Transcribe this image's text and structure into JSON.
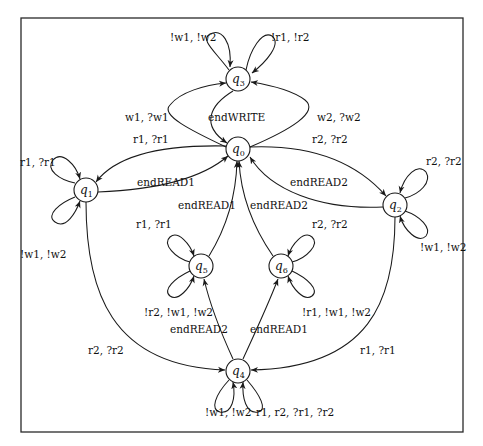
{
  "diagram": {
    "type": "state-machine",
    "frame": {
      "x": 21,
      "y": 18,
      "w": 442,
      "h": 414
    },
    "nodes": [
      {
        "id": "q0",
        "label": "q",
        "sub": "0",
        "x": 238,
        "y": 149
      },
      {
        "id": "q1",
        "label": "q",
        "sub": "1",
        "x": 86,
        "y": 190
      },
      {
        "id": "q2",
        "label": "q",
        "sub": "2",
        "x": 395,
        "y": 205
      },
      {
        "id": "q3",
        "label": "q",
        "sub": "3",
        "x": 238,
        "y": 79
      },
      {
        "id": "q4",
        "label": "q",
        "sub": "4",
        "x": 238,
        "y": 371
      },
      {
        "id": "q5",
        "label": "q",
        "sub": "5",
        "x": 201,
        "y": 266
      },
      {
        "id": "q6",
        "label": "q",
        "sub": "6",
        "x": 281,
        "y": 266
      }
    ],
    "edges": [
      {
        "from": "q0",
        "to": "q3",
        "label": "w1, ?w1"
      },
      {
        "from": "q3",
        "to": "q0",
        "label": "end_WRITE"
      },
      {
        "from": "q0",
        "to": "q3",
        "label": "w2, ?w2"
      },
      {
        "from": "q3",
        "to": "q3",
        "label": "!w1, !w2"
      },
      {
        "from": "q3",
        "to": "q3",
        "label": "!r1, !r2"
      },
      {
        "from": "q0",
        "to": "q1",
        "label": "r1, ?r1"
      },
      {
        "from": "q1",
        "to": "q0",
        "label": "end_READ1"
      },
      {
        "from": "q0",
        "to": "q2",
        "label": "r2, ?r2"
      },
      {
        "from": "q2",
        "to": "q0",
        "label": "end_READ2"
      },
      {
        "from": "q1",
        "to": "q1",
        "label": "r1, ?r1"
      },
      {
        "from": "q1",
        "to": "q1",
        "label": "!w1, !w2"
      },
      {
        "from": "q2",
        "to": "q2",
        "label": "r2, ?r2"
      },
      {
        "from": "q2",
        "to": "q2",
        "label": "!w1, !w2"
      },
      {
        "from": "q5",
        "to": "q0",
        "label": "end_READ1"
      },
      {
        "from": "q6",
        "to": "q0",
        "label": "end_READ2"
      },
      {
        "from": "q5",
        "to": "q5",
        "label": "r1, ?r1"
      },
      {
        "from": "q5",
        "to": "q5",
        "label": "!r2, !w1, !w2"
      },
      {
        "from": "q6",
        "to": "q6",
        "label": "r2, ?r2"
      },
      {
        "from": "q6",
        "to": "q6",
        "label": "!r1, !w1, !w2"
      },
      {
        "from": "q4",
        "to": "q5",
        "label": "end_READ2"
      },
      {
        "from": "q4",
        "to": "q6",
        "label": "end_READ1"
      },
      {
        "from": "q1",
        "to": "q4",
        "label": "r2, ?r2"
      },
      {
        "from": "q2",
        "to": "q4",
        "label": "r1, ?r1"
      },
      {
        "from": "q4",
        "to": "q4",
        "label": "!w1, !w2"
      },
      {
        "from": "q4",
        "to": "q4",
        "label": "r1, r2, ?r1, ?r2"
      }
    ]
  },
  "labels": {
    "q3_loop_left": "!w1, !w2",
    "q3_loop_right": "!r1, !r2",
    "q0_q3_left": "w1, ?w1",
    "q3_q0_mid": "endWRITE",
    "q0_q3_right": "w2, ?w2",
    "q0_q1": "r1, ?r1",
    "q0_q2": "r2, ?r2",
    "q1_loop_top": "r1, ?r1",
    "q1_loop_bottom": "!w1, !w2",
    "q2_loop_top": "r2, ?r2",
    "q2_loop_bottom": "!w1, !w2",
    "q1_q0": "endREAD1",
    "q2_q0": "endREAD2",
    "q5_q0": "endREAD1",
    "q6_q0": "endREAD2",
    "q5_loop_top": "r1, ?r1",
    "q5_loop_bottom": "!r2, !w1, !w2",
    "q6_loop_top": "r2, ?r2",
    "q6_loop_bottom": "!r1, !w1, !w2",
    "q4_q5": "endREAD2",
    "q4_q6": "endREAD1",
    "q1_q4": "r2, ?r2",
    "q2_q4": "r1, ?r1",
    "q4_loop_left": "!w1, !w2",
    "q4_loop_right": "r1, r2, ?r1, ?r2"
  }
}
